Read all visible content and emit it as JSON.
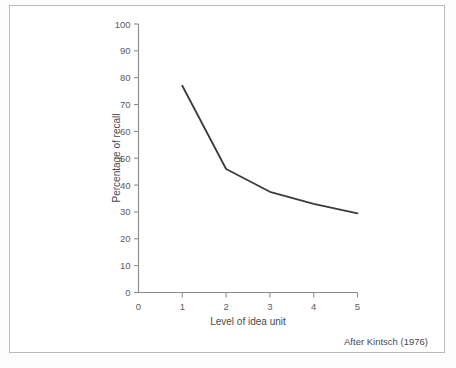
{
  "figure": {
    "source_note": "After Kintsch (1976)",
    "frame_color": "#b9b9b9",
    "line_color": "#3b3b3b",
    "axis_color": "#8c8c8c"
  },
  "chart_data": {
    "type": "line",
    "title": "",
    "subtitle": "",
    "xlabel": "Level of idea unit",
    "ylabel": "Percentage of recall",
    "x": [
      1,
      2,
      3,
      4,
      5
    ],
    "values": [
      77,
      46,
      37.5,
      33,
      29.5
    ],
    "series": [
      {
        "name": "Percentage of recall",
        "values": [
          77,
          46,
          37.5,
          33,
          29.5
        ]
      }
    ],
    "xlim": [
      0,
      5
    ],
    "ylim": [
      0,
      100
    ],
    "xticks": [
      0,
      1,
      2,
      3,
      4,
      5
    ],
    "xticklabels": [
      "0",
      "1",
      "2",
      "3",
      "4",
      "5"
    ],
    "yticks": [
      0,
      10,
      20,
      30,
      40,
      50,
      60,
      70,
      80,
      90,
      100
    ],
    "yticklabels": [
      "0",
      "10",
      "20",
      "30",
      "40",
      "50",
      "60",
      "70",
      "80",
      "90",
      "100"
    ],
    "grid": false,
    "legend": false,
    "legend_position": "none",
    "annotations": [
      "After Kintsch (1976)"
    ]
  }
}
